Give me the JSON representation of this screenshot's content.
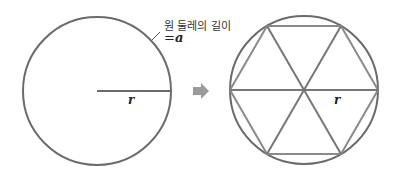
{
  "diagram": {
    "left_figure": {
      "shape": "circle",
      "center": [
        97,
        91
      ],
      "radius": 74,
      "radius_label": "r",
      "annotation_text": "원 둘레의 길이",
      "annotation_eq": "=",
      "annotation_var": "a"
    },
    "arrow": {
      "icon": "right-arrow-icon",
      "color": "#9a9a9a"
    },
    "right_figure": {
      "shape": "circle with inscribed regular hexagon divided into 6 equilateral triangles",
      "center": [
        304,
        90
      ],
      "radius": 74,
      "radius_label": "r"
    },
    "colors": {
      "circle_stroke": "#6b6b6b",
      "hexagon_edge": "#8a8a8a",
      "spoke": "#767676",
      "text": "#222222"
    }
  }
}
